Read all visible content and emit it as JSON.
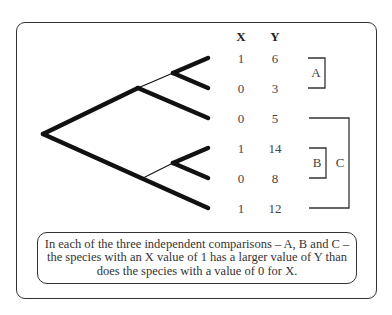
{
  "table": {
    "headers": [
      "X",
      "Y"
    ],
    "rows": [
      {
        "x": "1",
        "y": "6"
      },
      {
        "x": "0",
        "y": "3"
      },
      {
        "x": "0",
        "y": "5"
      },
      {
        "x": "1",
        "y": "14"
      },
      {
        "x": "0",
        "y": "8"
      },
      {
        "x": "1",
        "y": "12"
      }
    ]
  },
  "comparisons": [
    {
      "label": "A",
      "rows": [
        0,
        1
      ]
    },
    {
      "label": "B",
      "rows": [
        3,
        4
      ]
    },
    {
      "label": "C",
      "rows": [
        2,
        5
      ]
    }
  ],
  "tree": {
    "tips": 6,
    "structure": "((((1,2),3),((4,5),6))"
  },
  "caption": {
    "lines": [
      "In each of the three independent comparisons – A, B and C –",
      "the species with an X value of 1 has a larger value of Y than",
      "does the species with a value of 0 for X."
    ]
  },
  "colors": {
    "line": "#111111",
    "text": "#333333",
    "background": "#ffffff"
  }
}
